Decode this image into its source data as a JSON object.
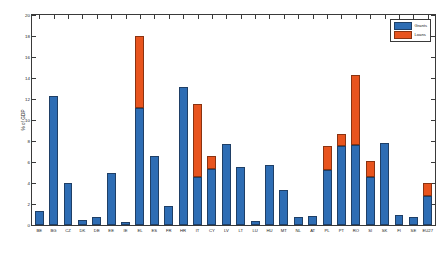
{
  "chart_data": {
    "type": "bar",
    "title": "",
    "xlabel": "",
    "ylabel": "% of GDP",
    "ylim": [
      0,
      20
    ],
    "ytick_values": [
      0,
      2,
      4,
      6,
      8,
      10,
      12,
      14,
      16,
      18,
      20
    ],
    "ytick_labels": [
      "0",
      "2",
      "4",
      "6",
      "8",
      "10",
      "12",
      "14",
      "16",
      "18",
      "20"
    ],
    "grid": false,
    "stacked": true,
    "legend_position": "top-right",
    "categories": [
      "BE",
      "BG",
      "CZ",
      "DK",
      "DE",
      "EE",
      "IE",
      "EL",
      "ES",
      "FR",
      "HR",
      "IT",
      "CY",
      "LV",
      "LT",
      "LU",
      "HU",
      "MT",
      "NL",
      "AT",
      "PL",
      "PT",
      "RO",
      "SI",
      "SK",
      "FI",
      "SE",
      "EU27"
    ],
    "series": [
      {
        "name": "Grants",
        "color": "#2E6DB4",
        "values": [
          1.3,
          12.3,
          4.0,
          0.5,
          0.8,
          5.0,
          0.3,
          11.1,
          6.6,
          1.8,
          13.1,
          4.6,
          5.3,
          7.7,
          5.5,
          0.4,
          5.7,
          3.3,
          0.8,
          0.9,
          5.2,
          7.5,
          7.6,
          4.6,
          7.8,
          1.0,
          0.8,
          2.8
        ]
      },
      {
        "name": "Loans",
        "color": "#E8541E",
        "values": [
          0,
          0,
          0,
          0,
          0,
          0,
          0,
          6.9,
          0,
          0,
          0,
          6.9,
          1.3,
          0,
          0,
          0,
          0,
          0,
          0,
          0,
          2.3,
          1.2,
          6.7,
          1.5,
          0,
          0,
          0,
          1.2
        ]
      }
    ],
    "totals": [
      1.3,
      12.3,
      4.0,
      0.5,
      0.8,
      5.0,
      0.3,
      18.0,
      6.6,
      1.8,
      13.1,
      11.5,
      6.6,
      7.7,
      5.5,
      0.4,
      5.7,
      3.3,
      0.8,
      0.9,
      7.5,
      8.7,
      14.3,
      6.1,
      7.8,
      1.0,
      0.8,
      4.0
    ]
  },
  "legend": {
    "entries": [
      {
        "label": "Grants"
      },
      {
        "label": "Loans"
      }
    ]
  }
}
